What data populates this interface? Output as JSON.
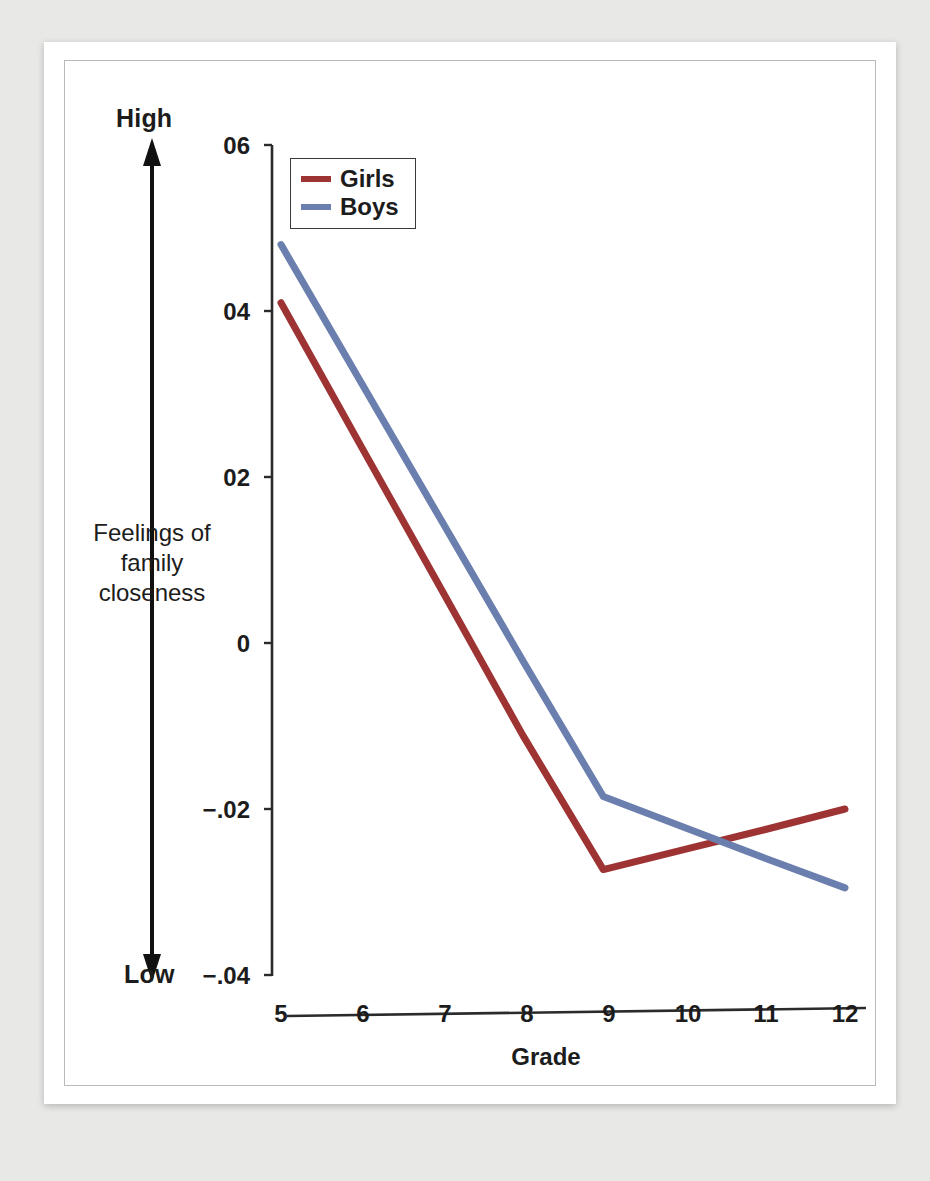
{
  "figure": {
    "background_color": "#ffffff",
    "page_background_color": "#e8e8e6"
  },
  "axes": {
    "y_title": "Feelings of family closeness",
    "y_high_label": "High",
    "y_low_label": "Low",
    "x_title": "Grade"
  },
  "legend": {
    "position": "top-left-inside",
    "entries": [
      {
        "label": "Girls",
        "color": "#9E3334"
      },
      {
        "label": "Boys",
        "color": "#6B7FAE"
      }
    ]
  },
  "chart_data": {
    "type": "line",
    "title": "",
    "subtitle": "",
    "xlabel": "Grade",
    "ylabel": "Feelings of family closeness",
    "x": [
      5,
      6,
      7,
      8,
      9,
      10,
      11,
      12
    ],
    "xticklabels": [
      "5",
      "6",
      "7",
      "8",
      "9",
      "10",
      "11",
      "12"
    ],
    "yticks": [
      0.06,
      0.04,
      0.02,
      0,
      -0.02,
      -0.04
    ],
    "yticklabels": [
      "06",
      "04",
      "02",
      "0",
      "−.02",
      "−.04"
    ],
    "ylim": [
      -0.04,
      0.06
    ],
    "xlim": [
      5,
      12
    ],
    "grid": false,
    "legend_position": "upper left",
    "annotations": [
      {
        "text": "High",
        "position": "above y-axis arrow"
      },
      {
        "text": "Low",
        "position": "below y-axis arrow"
      }
    ],
    "series": [
      {
        "name": "Girls",
        "color": "#9E3334",
        "values": [
          0.041,
          0.0236,
          0.0063,
          -0.0111,
          -0.0273,
          -0.0249,
          -0.0225,
          -0.02
        ]
      },
      {
        "name": "Boys",
        "color": "#6B7FAE",
        "values": [
          0.048,
          0.0313,
          0.0146,
          -0.0021,
          -0.0185,
          -0.0222,
          -0.0259,
          -0.0295
        ]
      }
    ]
  }
}
